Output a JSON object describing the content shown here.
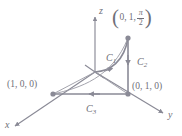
{
  "figure": {
    "type": "3d-coordinate-diagram",
    "background_color": "#ffffff",
    "line_color": "#8a8a96",
    "label_color": "#6f6f78",
    "axes": [
      {
        "name": "x",
        "label": "x",
        "direction": "down-left"
      },
      {
        "name": "y",
        "label": "y",
        "direction": "down-right"
      },
      {
        "name": "z",
        "label": "z",
        "direction": "up"
      }
    ],
    "points": [
      {
        "name": "point-x",
        "label": "(1, 0, 0)"
      },
      {
        "name": "point-y",
        "label": "(0, 1, 0)"
      },
      {
        "name": "point-top",
        "label_x": "0,",
        "label_y": "1,",
        "label_num": "π",
        "label_den": "2"
      }
    ],
    "curves": [
      {
        "name": "C1",
        "label": "C",
        "subscript": "1",
        "shape": "curve",
        "from": "origin",
        "to": "point-top",
        "arrow": "toward point-top"
      },
      {
        "name": "C2",
        "label": "C",
        "subscript": "2",
        "shape": "vertical-segment",
        "from": "point-top",
        "to": "point-y",
        "arrow": "downward"
      },
      {
        "name": "C3",
        "label": "C",
        "subscript": "3",
        "shape": "horizontal-segment",
        "from": "point-y",
        "to": "point-x",
        "arrow": "leftward"
      }
    ]
  }
}
